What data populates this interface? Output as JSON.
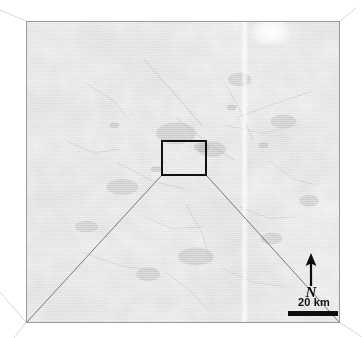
{
  "figure": {
    "type": "satellite-radar-map-with-inset-callout",
    "canvas": {
      "width": 362,
      "height": 338,
      "background": "#ffffff"
    }
  },
  "map": {
    "panel": {
      "name": "satellite-image-panel",
      "x": 26,
      "y": 21,
      "width": 314,
      "height": 302,
      "border_color": "#9a9a9a",
      "base_color": "#dedede",
      "description": "grayscale radar / satellite backscatter image with mottled texture and faint horizontal scanlines"
    },
    "bright_patch": {
      "x": 272,
      "y": 31,
      "rx": 14,
      "ry": 9,
      "color": "#fdfdfd"
    },
    "faint_vertical_seam": {
      "x": 245,
      "color": "#efefef"
    }
  },
  "roi": {
    "name": "region-of-interest-box",
    "x": 161,
    "y": 140,
    "width": 46,
    "height": 36,
    "stroke_color": "#111111",
    "stroke_width": 2
  },
  "leaders": {
    "stroke_color": "#6b6b6b",
    "stroke_width": 0.9,
    "lines": [
      {
        "x1": 161,
        "y1": 176,
        "x2": 27,
        "y2": 322
      },
      {
        "x1": 207,
        "y1": 176,
        "x2": 339,
        "y2": 322
      }
    ]
  },
  "guides": {
    "stroke_color": "#d2d2d2",
    "stroke_width": 0.9,
    "lines": [
      {
        "x1": 26,
        "y1": 21,
        "x2": 0,
        "y2": 10
      },
      {
        "x1": 26,
        "y1": 322,
        "x2": 0,
        "y2": 292
      },
      {
        "x1": 26,
        "y1": 322,
        "x2": 14,
        "y2": 338
      },
      {
        "x1": 340,
        "y1": 21,
        "x2": 356,
        "y2": 8
      },
      {
        "x1": 339,
        "y1": 322,
        "x2": 362,
        "y2": 337
      }
    ]
  },
  "north_arrow": {
    "name": "north-arrow",
    "label": "N",
    "color": "#0d0d0d"
  },
  "scale_bar": {
    "name": "scale-bar",
    "label": "20 km",
    "length_px": 50,
    "color": "#0d0d0d"
  },
  "colors": {
    "ink": "#111111",
    "leader": "#6b6b6b",
    "guide": "#d2d2d2",
    "panel_border": "#9a9a9a",
    "raster_base": "#dedede"
  }
}
